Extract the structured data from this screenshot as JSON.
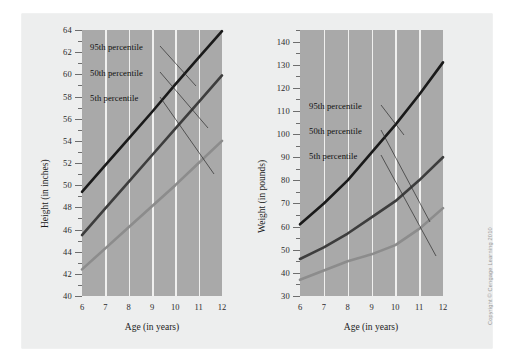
{
  "credit": "Copyright © Cengage Learning 2010",
  "colors": {
    "plot_background": "#a9a9a9",
    "page_background": "#edeeee",
    "gridline": "#f0f0ef",
    "p95_line": "#1a1a1a",
    "p50_line": "#3d3d3d",
    "p5_line": "#8c8c8c",
    "leader_line": "#2b2b2b",
    "tick": "#6e6e6e",
    "text": "#1c1c1c"
  },
  "charts": [
    {
      "id": "height-chart",
      "title": "",
      "xlabel": "Age (in years)",
      "ylabel": "Height (in inches)",
      "xticks": [
        "6",
        "7",
        "8",
        "9",
        "10",
        "11",
        "12"
      ],
      "yticks": [
        "40",
        "42",
        "44",
        "46",
        "48",
        "50",
        "52",
        "54",
        "56",
        "58",
        "60",
        "62",
        "64"
      ],
      "legend": [
        "95th percentile",
        "50th percentile",
        "5th percentile"
      ],
      "chart_data": {
        "type": "line",
        "title": "",
        "xlabel": "Age (in years)",
        "ylabel": "Height (in inches)",
        "x": [
          6,
          7,
          8,
          9,
          10,
          11,
          12
        ],
        "xlim": [
          6,
          12
        ],
        "ylim": [
          40,
          64
        ],
        "ytick_step": 2,
        "yminor_step": 1,
        "grid": "vertical",
        "legend_position": "inside-top-left",
        "series": [
          {
            "name": "95th percentile",
            "color": "#1a1a1a",
            "values": [
              49.4,
              51.8,
              54.2,
              56.6,
              59.1,
              61.5,
              63.9
            ]
          },
          {
            "name": "50th percentile",
            "color": "#3d3d3d",
            "values": [
              45.5,
              47.9,
              50.3,
              52.7,
              55.1,
              57.5,
              59.9
            ]
          },
          {
            "name": "5th percentile",
            "color": "#8c8c8c",
            "values": [
              42.4,
              44.3,
              46.2,
              48.1,
              50.0,
              52.0,
              54.0
            ]
          }
        ]
      }
    },
    {
      "id": "weight-chart",
      "title": "",
      "xlabel": "Age (in years)",
      "ylabel": "Weight (in pounds)",
      "xticks": [
        "6",
        "7",
        "8",
        "9",
        "10",
        "11",
        "12"
      ],
      "yticks": [
        "30",
        "40",
        "50",
        "60",
        "70",
        "80",
        "90",
        "100",
        "110",
        "120",
        "130",
        "140"
      ],
      "legend": [
        "95th percentile",
        "50th percentile",
        "5th percentile"
      ],
      "chart_data": {
        "type": "line",
        "title": "",
        "xlabel": "Age (in years)",
        "ylabel": "Weight (in pounds)",
        "x": [
          6,
          7,
          8,
          9,
          10,
          11,
          12
        ],
        "xlim": [
          6,
          12
        ],
        "ylim": [
          30,
          145
        ],
        "ytick_step": 10,
        "yminor_step": 5,
        "grid": "vertical",
        "legend_position": "inside-top-left",
        "series": [
          {
            "name": "95th percentile",
            "color": "#1a1a1a",
            "values": [
              61,
              70,
              80,
              92,
              104,
              117,
              131
            ]
          },
          {
            "name": "50th percentile",
            "color": "#3d3d3d",
            "values": [
              46,
              51,
              57,
              64,
              71,
              80,
              90
            ]
          },
          {
            "name": "5th percentile",
            "color": "#8c8c8c",
            "values": [
              37,
              41,
              45,
              48,
              52,
              59,
              68
            ]
          }
        ]
      }
    }
  ]
}
